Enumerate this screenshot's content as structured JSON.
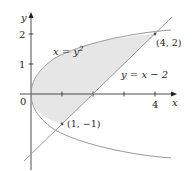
{
  "diagram": {
    "type": "region-between-curves",
    "axes": {
      "x_label": "x",
      "y_label": "y",
      "origin_label": "0",
      "x_ticks": [
        {
          "value": 1,
          "label": ""
        },
        {
          "value": 2,
          "label": ""
        },
        {
          "value": 3,
          "label": ""
        },
        {
          "value": 4,
          "label": "4"
        }
      ],
      "y_ticks": [
        {
          "value": 1,
          "label": "1"
        },
        {
          "value": 2,
          "label": "2"
        }
      ]
    },
    "curves": [
      {
        "name": "parabola",
        "equation_lhs": "x = y",
        "exponent": "2",
        "label": "x = y²"
      },
      {
        "name": "line",
        "label": "y = x − 2"
      }
    ],
    "points": [
      {
        "label": "(4, 2)",
        "x": 4,
        "y": 2
      },
      {
        "label": "(1, −1)",
        "x": 1,
        "y": -1
      }
    ],
    "colors": {
      "axis": "#231f20",
      "curve": "#9a9a9a",
      "shade": "#e6e6e6",
      "text": "#231f20"
    }
  }
}
